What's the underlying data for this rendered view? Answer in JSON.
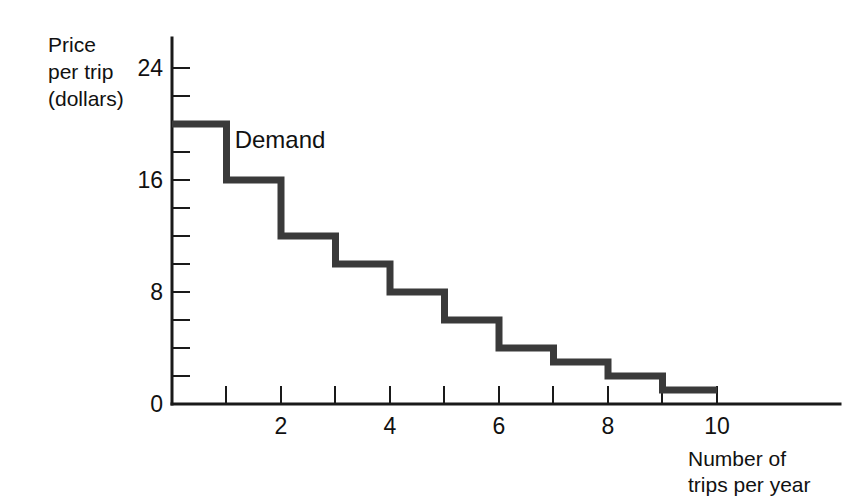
{
  "chart_data": {
    "type": "line",
    "subtype": "step",
    "title": "",
    "xlabel": "Number of trips per year",
    "ylabel": "Price per trip (dollars)",
    "ylabel_lines": [
      "Price",
      "per trip",
      "(dollars)"
    ],
    "xlabel_lines": [
      "Number of",
      "trips per year"
    ],
    "series": [
      {
        "name": "Demand",
        "x": [
          1,
          2,
          3,
          4,
          5,
          6,
          7,
          8,
          9,
          10
        ],
        "values": [
          20,
          16,
          12,
          10,
          8,
          6,
          4,
          3,
          2,
          1
        ]
      }
    ],
    "annotations": [
      {
        "text": "Demand",
        "x": 1.15,
        "y": 18.3
      }
    ],
    "xlim": [
      0,
      12
    ],
    "ylim": [
      0,
      25
    ],
    "x_ticks": [
      1,
      2,
      3,
      4,
      5,
      6,
      7,
      8,
      9,
      10
    ],
    "x_tick_labels": [
      "",
      "2",
      "",
      "4",
      "",
      "6",
      "",
      "8",
      "",
      "10"
    ],
    "y_ticks": [
      0,
      2,
      4,
      6,
      8,
      10,
      12,
      14,
      16,
      18,
      20,
      22,
      24
    ],
    "y_tick_labels": [
      "0",
      "",
      "",
      "",
      "8",
      "",
      "",
      "",
      "16",
      "",
      "",
      "",
      "24"
    ],
    "grid": false,
    "legend": "none",
    "curve_color": "#3a3a3a",
    "axis_color": "#1a1a1a",
    "background_color": "#ffffff"
  },
  "axes": {
    "y_title_line1": "Price",
    "y_title_line2": "per trip",
    "y_title_line3": "(dollars)",
    "x_title_line1": "Number of",
    "x_title_line2": "trips per year",
    "y_label_24": "24",
    "y_label_16": "16",
    "y_label_8": "8",
    "y_label_0": "0",
    "x_label_2": "2",
    "x_label_4": "4",
    "x_label_6": "6",
    "x_label_8": "8",
    "x_label_10": "10"
  },
  "curve": {
    "label": "Demand"
  }
}
